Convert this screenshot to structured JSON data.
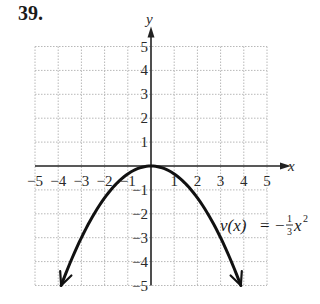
{
  "problem": {
    "number": "39."
  },
  "chart_data": {
    "type": "line",
    "title": "",
    "function_label": "v(x) = -1/3 x^2",
    "equation": {
      "lhs": "v(x)",
      "eq": "=",
      "sign": "−",
      "frac_num": "1",
      "frac_den": "3",
      "var": "x",
      "exp": "2"
    },
    "xlabel": "x",
    "ylabel": "y",
    "xlim": [
      -5,
      5
    ],
    "ylim": [
      -5,
      5
    ],
    "x_ticks": [
      "−5",
      "−4",
      "−3",
      "−2",
      "−1",
      "1",
      "2",
      "3",
      "4",
      "5"
    ],
    "y_ticks": [
      "5",
      "4",
      "3",
      "2",
      "1",
      "−1",
      "−2",
      "−3",
      "−4",
      "−5"
    ],
    "grid": true,
    "grid_style": "dotted",
    "arrows": "both ends of curve pointing down",
    "series": [
      {
        "name": "v(x)",
        "x": [
          -3.873,
          -3,
          -2,
          -1,
          0,
          1,
          2,
          3,
          3.873
        ],
        "y": [
          -5,
          -3,
          -1.333,
          -0.333,
          0,
          -0.333,
          -1.333,
          -3,
          -5
        ]
      }
    ],
    "vertex": [
      0,
      0
    ]
  }
}
